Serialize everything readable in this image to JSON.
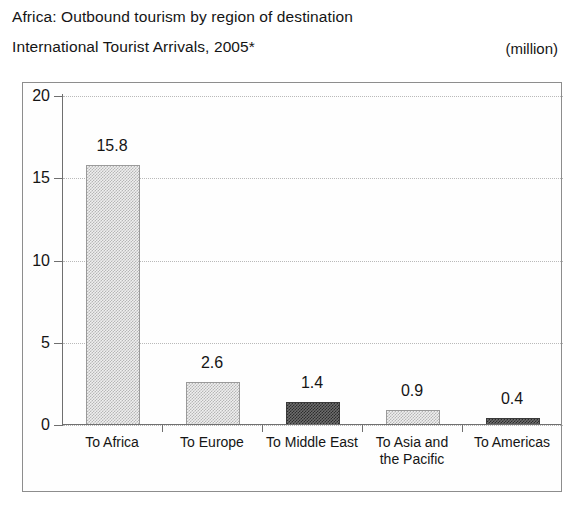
{
  "header": {
    "title_line1": "Africa: Outbound tourism by region of destination",
    "title_line2": "International Tourist Arrivals, 2005*",
    "unit_note": "(million)"
  },
  "chart_data": {
    "type": "bar",
    "subtitle": "International Tourist Arrivals, 2005*",
    "unit": "million",
    "xlabel": "",
    "ylabel": "",
    "ylim": [
      0,
      20
    ],
    "yticks": [
      0,
      5,
      10,
      15,
      20
    ],
    "ytick_labels": [
      "0",
      "5",
      "10",
      "15",
      "20"
    ],
    "grid": true,
    "grid_axis": "y",
    "legend": "none",
    "categories": [
      "To Africa",
      "To Europe",
      "To Middle East",
      "To Asia and the Pacific",
      "To Americas"
    ],
    "category_lines": [
      [
        "To Africa"
      ],
      [
        "To Europe"
      ],
      [
        "To Middle East"
      ],
      [
        "To Asia and",
        "the Pacific"
      ],
      [
        "To Americas"
      ]
    ],
    "values": [
      15.8,
      2.6,
      1.4,
      0.9,
      0.4
    ],
    "value_labels": [
      "15.8",
      "2.6",
      "1.4",
      "0.9",
      "0.4"
    ],
    "bar_styles": [
      "light",
      "light",
      "dark",
      "light",
      "dark"
    ],
    "colors": {
      "bar_light_fill": "#efefef",
      "bar_light_pattern": "#b6b6b6",
      "bar_dark_fill": "#6d6d6d",
      "bar_dark_pattern": "#2b2b2b",
      "axis": "#6f6f6f",
      "gridline": "#b9b9b9",
      "frame": "#8d8d8d",
      "text": "#151515",
      "background": "#ffffff"
    }
  }
}
